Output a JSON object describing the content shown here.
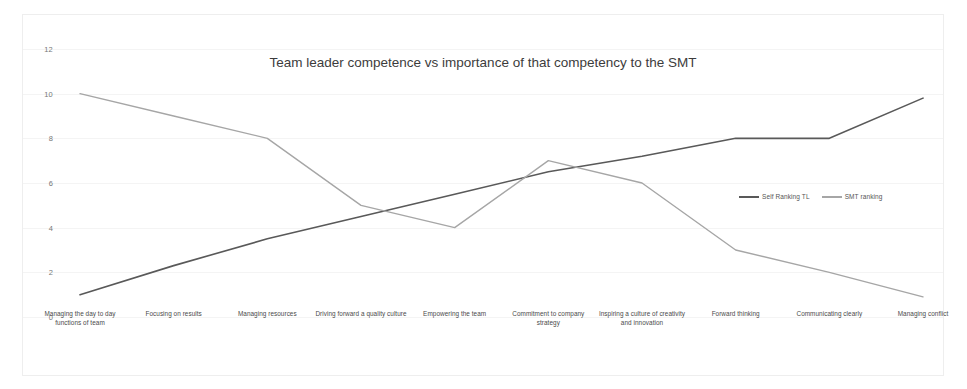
{
  "chart_data": {
    "type": "line",
    "title": "Team leader competence vs importance of that competency to the SMT",
    "xlabel": "",
    "ylabel": "",
    "ylim": [
      0,
      12
    ],
    "yticks": [
      0,
      2,
      4,
      6,
      8,
      10,
      12
    ],
    "ytick_labels": [
      "0",
      "2",
      "4",
      "6",
      "8",
      "10",
      "12"
    ],
    "grid": true,
    "legend_position": "center-right",
    "categories": [
      "Managing the day to day functions of team",
      "Focusing on  results",
      "Managing resources",
      "Driving forward a quality culture",
      "Empowering the team",
      "Commitment to company strategy",
      "Inspiring a culture of creativity and innovation",
      "Forward thinking",
      "Communicating clearly",
      "Managing conflict"
    ],
    "series": [
      {
        "name": "Self Ranking TL",
        "color": "#595959",
        "values": [
          1,
          2.3,
          3.5,
          4.5,
          5.5,
          6.5,
          7.2,
          8,
          8,
          9.8
        ]
      },
      {
        "name": "SMT ranking",
        "color": "#a6a6a6",
        "values": [
          10,
          9,
          8,
          5,
          4,
          7,
          6,
          3,
          2,
          0.9
        ]
      }
    ]
  },
  "colors": {
    "card_border": "#eeeeee",
    "gridline": "#f4f4f4",
    "tick_text": "#777777",
    "title_text": "#3c3c3c"
  }
}
